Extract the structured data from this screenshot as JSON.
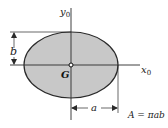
{
  "diagram": {
    "colors": {
      "fill": "#c8c8c8",
      "stroke": "#2a2a2a",
      "background": "#ffffff"
    },
    "labels": {
      "y_axis": "y",
      "y_axis_sub": "0",
      "x_axis": "x",
      "x_axis_sub": "0",
      "centroid": "G",
      "semi_minor": "b",
      "semi_major": "a",
      "formula": "A = πab"
    }
  }
}
